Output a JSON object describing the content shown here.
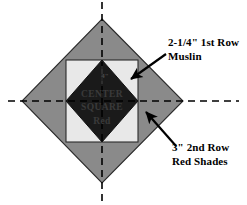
{
  "diagram": {
    "canvas": {
      "width": 247,
      "height": 205,
      "background": "#ffffff"
    },
    "center": {
      "x": 102,
      "y": 101
    },
    "colors": {
      "outer_diamond": "#8a8a8a",
      "muslin_square": "#e8e8e8",
      "center_square": "#1a1a1a",
      "outline": "#2b2b2b",
      "axis": "#000000",
      "arrow": "#000000",
      "text": "#000000"
    },
    "shapes": {
      "outer_diamond": {
        "name": "2nd Row Red Shades",
        "points": "102,19 183,101 102,183 22,101",
        "fill": "#8a8a8a"
      },
      "muslin_square": {
        "name": "1st Row Muslin",
        "x": 66,
        "y": 60,
        "width": 72,
        "height": 82,
        "fill": "#e8e8e8"
      },
      "center_square": {
        "name": "Center Square",
        "points": "102,60 138,101 102,142 66,101",
        "fill": "#1a1a1a"
      }
    },
    "axes": {
      "horizontal": {
        "x1": 8,
        "y1": 101,
        "x2": 239,
        "y2": 101
      },
      "vertical": {
        "x1": 102,
        "y1": 2,
        "x2": 102,
        "y2": 202
      },
      "dash": "7 5",
      "width": 1.6
    },
    "center_label": {
      "line1": "CENTER",
      "line2": "SQUARE",
      "line3": "Red",
      "dimension": "4\""
    },
    "annotations": [
      {
        "id": "muslin",
        "line1": "2-1/4\" 1st Row",
        "line2": "Muslin",
        "text_x": 168,
        "text_y1": 46,
        "text_y2": 60,
        "arrow": {
          "x1": 166,
          "y1": 54,
          "x2": 130,
          "y2": 80
        }
      },
      {
        "id": "red-shades",
        "line1": "3\" 2nd Row",
        "line2": "Red Shades",
        "text_x": 172,
        "text_y1": 151,
        "text_y2": 165,
        "arrow": {
          "x1": 176,
          "y1": 146,
          "x2": 145,
          "y2": 111
        }
      }
    ]
  }
}
